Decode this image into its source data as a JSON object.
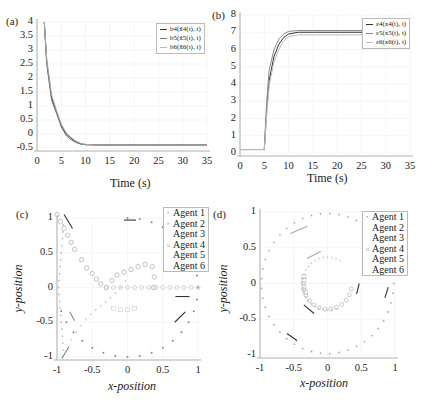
{
  "chart_data": [
    {
      "panel": "(a)",
      "type": "line",
      "xlabel": "Time (s)",
      "ylabel": "",
      "xlim": [
        0,
        35
      ],
      "ylim": [
        -0.5,
        4
      ],
      "xticks": [
        "0",
        "5",
        "10",
        "15",
        "20",
        "25",
        "30",
        "35"
      ],
      "yticks": [
        "-0.5",
        "0",
        "0.5",
        "1",
        "1.5",
        "2",
        "2.5",
        "3",
        "3.5",
        "4"
      ],
      "grid": true,
      "legend_position": "upper right",
      "series": [
        {
          "name": "b4(x̂4(t), t)",
          "color": "#333333",
          "x": [
            1.5,
            2,
            3,
            4,
            5,
            6,
            7,
            8,
            9,
            10,
            12,
            15,
            20,
            25,
            30,
            35
          ],
          "y": [
            4,
            2.6,
            1.3,
            0.8,
            0.3,
            0.0,
            -0.15,
            -0.28,
            -0.35,
            -0.38,
            -0.39,
            -0.39,
            -0.39,
            -0.39,
            -0.39,
            -0.39
          ]
        },
        {
          "name": "b5(x̂5(t), t)",
          "color": "#777777",
          "x": [
            1.5,
            2,
            3,
            4,
            5,
            6,
            7,
            8,
            9,
            10,
            12,
            15,
            20,
            25,
            30,
            35
          ],
          "y": [
            4,
            2.5,
            1.2,
            0.75,
            0.25,
            -0.05,
            -0.2,
            -0.3,
            -0.36,
            -0.38,
            -0.39,
            -0.39,
            -0.39,
            -0.39,
            -0.39,
            -0.39
          ]
        },
        {
          "name": "b6(x̂6(t), t)",
          "color": "#aaaaaa",
          "x": [
            1.5,
            2,
            3,
            4,
            5,
            6,
            7,
            8,
            9,
            10,
            12,
            15,
            20,
            25,
            30,
            35
          ],
          "y": [
            4,
            2.7,
            1.4,
            0.85,
            0.35,
            0.05,
            -0.12,
            -0.25,
            -0.33,
            -0.37,
            -0.39,
            -0.39,
            -0.39,
            -0.39,
            -0.39,
            -0.39
          ]
        }
      ]
    },
    {
      "panel": "(b)",
      "type": "line",
      "xlabel": "Time (s)",
      "ylabel": "",
      "xlim": [
        0,
        35
      ],
      "ylim": [
        0,
        8
      ],
      "xticks": [
        "0",
        "5",
        "10",
        "15",
        "20",
        "25",
        "30",
        "35"
      ],
      "yticks": [
        "0",
        "1",
        "2",
        "3",
        "4",
        "5",
        "6",
        "7",
        "8"
      ],
      "grid": true,
      "legend_position": "upper right",
      "series": [
        {
          "name": "ε4(x4(t), t)",
          "color": "#333333",
          "x": [
            0,
            5,
            5.5,
            6,
            7,
            8,
            9,
            10,
            12,
            15,
            20,
            35
          ],
          "y": [
            0.2,
            0.2,
            2.5,
            4.2,
            5.6,
            6.3,
            6.7,
            6.9,
            7.0,
            7.0,
            7.0,
            7.0
          ]
        },
        {
          "name": "ε5(x5(t), t)",
          "color": "#888888",
          "x": [
            0,
            5,
            5.5,
            6,
            7,
            8,
            9,
            10,
            12,
            15,
            20,
            35
          ],
          "y": [
            0.2,
            0.2,
            3.0,
            4.8,
            6.0,
            6.6,
            6.9,
            7.05,
            7.1,
            7.1,
            7.1,
            7.1
          ]
        },
        {
          "name": "ε6(x6(t), t)",
          "color": "#bbbbbb",
          "x": [
            0,
            5,
            5.5,
            6,
            7,
            8,
            9,
            10,
            12,
            15,
            20,
            35
          ],
          "y": [
            0.2,
            0.2,
            2.2,
            3.9,
            5.3,
            6.0,
            6.5,
            6.75,
            6.85,
            6.85,
            6.85,
            6.85
          ]
        }
      ]
    },
    {
      "panel": "(c)",
      "type": "scatter",
      "xlabel": "x-position",
      "ylabel": "y-position",
      "xlim": [
        -1,
        1
      ],
      "ylim": [
        -1,
        1
      ],
      "xticks": [
        "-1",
        "-0.5",
        "0",
        "0.5",
        "1"
      ],
      "yticks": [
        "-1",
        "-0.5",
        "0",
        "0.5",
        "1"
      ],
      "grid": true,
      "legend_position": "upper right",
      "series": [
        {
          "name": "Agent 1",
          "marker": "dot",
          "color": "#777777"
        },
        {
          "name": "Agent 2",
          "marker": "dot",
          "color": "#999999"
        },
        {
          "name": "Agent 3",
          "marker": "dot",
          "color": "#bbbbbb"
        },
        {
          "name": "Agent 4",
          "marker": "circle",
          "color": "#999999"
        },
        {
          "name": "Agent 5",
          "marker": "square",
          "color": "#bbbbbb"
        },
        {
          "name": "Agent 6",
          "marker": "none",
          "color": "#cccccc"
        }
      ]
    },
    {
      "panel": "(d)",
      "type": "scatter",
      "xlabel": "x-position",
      "ylabel": "y-position",
      "xlim": [
        -1,
        1
      ],
      "ylim": [
        -1,
        1
      ],
      "xticks": [
        "-1",
        "-0.5",
        "0",
        "0.5",
        "1"
      ],
      "yticks": [
        "-1",
        "-0.5",
        "0",
        "0.5",
        "1"
      ],
      "grid": true,
      "legend_position": "upper right",
      "series": [
        {
          "name": "Agent 1",
          "marker": "dot",
          "color": "#888888"
        },
        {
          "name": "Agent 2",
          "marker": "dot",
          "color": "#aaaaaa"
        },
        {
          "name": "Agent 3",
          "marker": "dot",
          "color": "#bbbbbb"
        },
        {
          "name": "Agent 4",
          "marker": "circle",
          "color": "#999999"
        },
        {
          "name": "Agent 5",
          "marker": "square",
          "color": "#bbbbbb"
        },
        {
          "name": "Agent 6",
          "marker": "none",
          "color": "#cccccc"
        }
      ]
    }
  ],
  "panels": {
    "a": {
      "letter": "(a)",
      "xlabel": "Time (s)",
      "legend": [
        "b4(x̂4(t), t)",
        "b5(x̂5(t), t)",
        "b6(x̂6(t), t)"
      ]
    },
    "b": {
      "letter": "(b)",
      "xlabel": "Time (s)",
      "legend": [
        "ε4(x4(t), t)",
        "ε5(x5(t), t)",
        "ε6(x6(t), t)"
      ]
    },
    "c": {
      "letter": "(c)",
      "xlabel": "x-position",
      "ylabel": "y-position",
      "legend": [
        "Agent 1",
        "Agent 2",
        "Agent 3",
        "Agent 4",
        "Agent 5",
        "Agent 6"
      ]
    },
    "d": {
      "letter": "(d)",
      "xlabel": "x-position",
      "ylabel": "y-position",
      "legend": [
        "Agent 1",
        "Agent 2",
        "Agent 3",
        "Agent 4",
        "Agent 5",
        "Agent 6"
      ]
    }
  }
}
